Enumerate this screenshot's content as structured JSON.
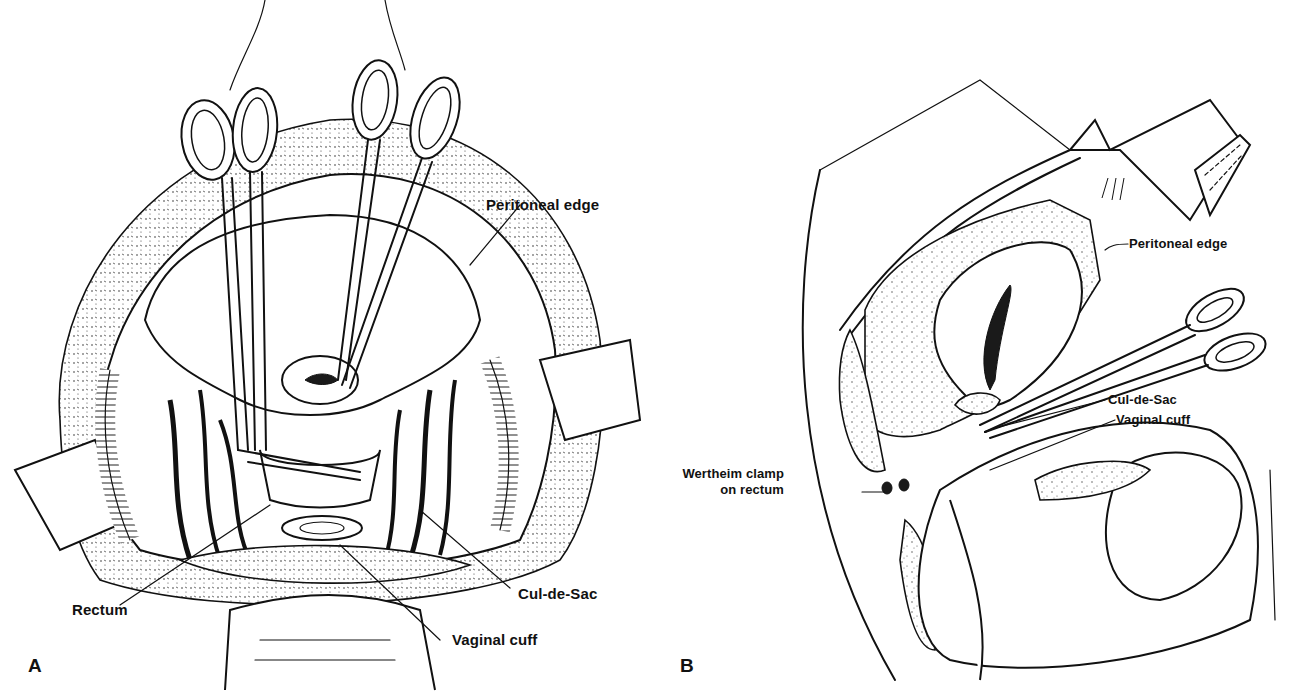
{
  "figure": {
    "panels": [
      {
        "id": "A",
        "letter": "A",
        "view": "operative view from above",
        "labels": {
          "peritoneal_edge": "Peritoneal edge",
          "rectum": "Rectum",
          "cul_de_sac": "Cul-de-Sac",
          "vaginal_cuff": "Vaginal cuff"
        }
      },
      {
        "id": "B",
        "letter": "B",
        "view": "sagittal section",
        "labels": {
          "peritoneal_edge": "Peritoneal edge",
          "cul_de_sac": "Cul-de-Sac",
          "vaginal_cuff": "Vaginal cuff",
          "wertheim_line1": "Wertheim clamp",
          "wertheim_line2": "on rectum"
        }
      }
    ],
    "colors": {
      "ink": "#111111",
      "background": "#ffffff"
    }
  }
}
